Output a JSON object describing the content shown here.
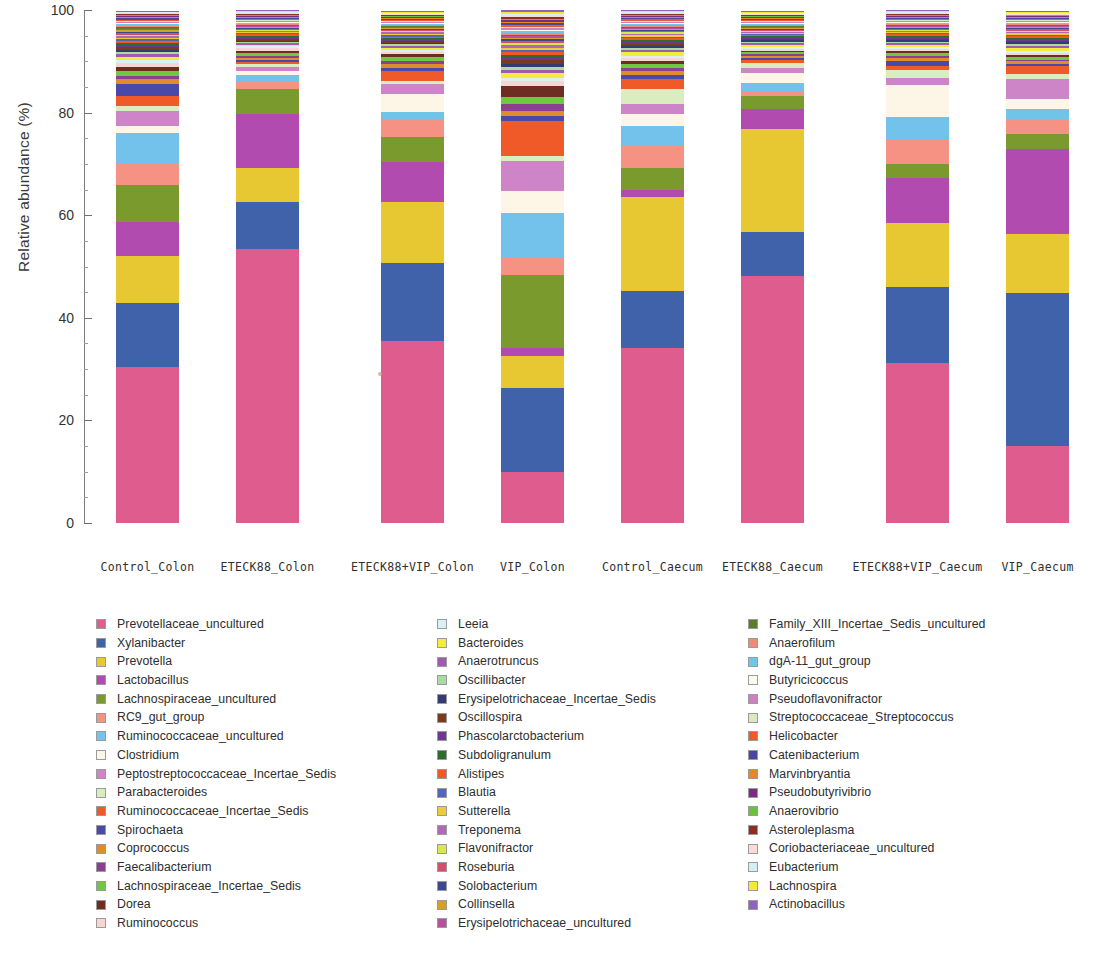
{
  "chart_data": {
    "type": "bar",
    "subtype": "stacked-bar-100-percent",
    "title": "",
    "xlabel": "",
    "ylabel": "Relative abundance (%)",
    "ylim": [
      0,
      100
    ],
    "yticks": [
      0,
      20,
      40,
      60,
      80,
      100
    ],
    "ytick_labels": [
      "0",
      "20",
      "40",
      "60",
      "80",
      "100"
    ],
    "grid": false,
    "legend_position": "bottom",
    "legend_columns": 3,
    "categories": [
      "Control_Colon",
      "ETECK88_Colon",
      "ETECK88+VIP_Colon",
      "VIP_Colon",
      "Control_Caecum",
      "ETECK88_Caecum",
      "ETECK88+VIP_Caecum",
      "VIP_Caecum"
    ],
    "series": [
      {
        "name": "Prevotellaceae_uncultured",
        "color": "#de5c8e",
        "values": [
          31.5,
          56.0,
          36.0,
          9.5,
          35.5,
          48.0,
          32.5,
          15.5
        ]
      },
      {
        "name": "Xylanibacter",
        "color": "#3f62aa",
        "values": [
          13.0,
          9.5,
          15.5,
          15.5,
          11.5,
          8.5,
          15.5,
          30.5
        ]
      },
      {
        "name": "Prevotella",
        "color": "#e8c832",
        "values": [
          9.5,
          7.0,
          12.0,
          6.0,
          19.0,
          20.0,
          13.0,
          12.0
        ]
      },
      {
        "name": "Lactobacillus",
        "color": "#b14bb0",
        "values": [
          7.0,
          11.0,
          8.0,
          1.5,
          1.5,
          4.0,
          9.0,
          17.0
        ]
      },
      {
        "name": "Lachnospiraceae_uncultured",
        "color": "#7a9a2e",
        "values": [
          7.5,
          5.0,
          5.0,
          13.5,
          4.5,
          2.5,
          3.0,
          3.0
        ]
      },
      {
        "name": "RC9_gut_group",
        "color": "#f59283",
        "values": [
          4.5,
          1.5,
          3.5,
          3.0,
          4.5,
          1.0,
          5.0,
          3.0
        ]
      },
      {
        "name": "Ruminococcaceae_uncultured",
        "color": "#73c2ec",
        "values": [
          6.0,
          1.5,
          1.5,
          8.5,
          4.0,
          1.5,
          4.5,
          2.0
        ]
      },
      {
        "name": "Clostridium",
        "color": "#fdf6e6",
        "values": [
          1.5,
          0.8,
          3.5,
          4.0,
          2.5,
          2.0,
          6.5,
          2.0
        ]
      },
      {
        "name": "Peptostreptococcaceae_Incertae_Sedis",
        "color": "#cd85c8",
        "values": [
          3.0,
          0.8,
          2.0,
          5.5,
          2.0,
          1.0,
          1.5,
          4.0
        ]
      },
      {
        "name": "Parabacteroides",
        "color": "#d9edc0",
        "values": [
          1.0,
          0.5,
          0.5,
          1.0,
          3.0,
          1.0,
          1.5,
          1.0
        ]
      },
      {
        "name": "Ruminococcaceae_Incertae_Sedis",
        "color": "#ef5a28",
        "values": [
          2.0,
          0.5,
          2.0,
          6.5,
          2.0,
          0.5,
          0.8,
          1.5
        ]
      },
      {
        "name": "Spirochaeta",
        "color": "#4a48a8",
        "values": [
          2.5,
          0.5,
          0.6,
          0.8,
          0.8,
          0.4,
          1.0,
          0.5
        ]
      },
      {
        "name": "Coprococcus",
        "color": "#e08c2a",
        "values": [
          0.9,
          0.4,
          0.9,
          1.0,
          0.9,
          0.4,
          0.6,
          0.5
        ]
      },
      {
        "name": "Faecalibacterium",
        "color": "#8b3f8f",
        "values": [
          0.6,
          0.4,
          0.6,
          1.3,
          0.6,
          0.4,
          0.5,
          0.4
        ]
      },
      {
        "name": "Lachnospiraceae_Incertae_Sedis",
        "color": "#6fc83f",
        "values": [
          1.0,
          0.5,
          0.8,
          1.4,
          0.8,
          0.3,
          0.5,
          0.6
        ]
      },
      {
        "name": "Dorea",
        "color": "#6e2d22",
        "values": [
          1.0,
          0.4,
          0.5,
          2.0,
          0.5,
          0.3,
          0.4,
          0.4
        ]
      },
      {
        "name": "Ruminococcus",
        "color": "#f7d6d2",
        "values": [
          0.8,
          0.6,
          0.4,
          0.8,
          0.7,
          0.4,
          0.5,
          0.4
        ]
      },
      {
        "name": "Leeia",
        "color": "#d9f0f5",
        "values": [
          0.6,
          0.4,
          0.4,
          0.7,
          0.5,
          0.3,
          0.4,
          0.4
        ]
      },
      {
        "name": "Bacteroides",
        "color": "#f3ec3a",
        "values": [
          0.6,
          0.3,
          0.5,
          0.8,
          0.8,
          0.5,
          0.5,
          0.6
        ]
      },
      {
        "name": "Anaerotruncus",
        "color": "#a05ab0",
        "values": [
          0.5,
          0.3,
          0.4,
          0.6,
          0.4,
          0.3,
          0.3,
          0.4
        ]
      },
      {
        "name": "Oscillibacter",
        "color": "#a8dca0",
        "values": [
          0.4,
          0.3,
          0.3,
          0.5,
          0.4,
          0.3,
          0.3,
          0.3
        ]
      },
      {
        "name": "Erysipelotrichaceae_Incertae_Sedis",
        "color": "#343b6e",
        "values": [
          0.5,
          0.3,
          0.3,
          0.7,
          0.4,
          0.3,
          0.3,
          0.4
        ]
      },
      {
        "name": "Oscillospira",
        "color": "#7a3b1c",
        "values": [
          0.5,
          0.4,
          0.3,
          0.6,
          0.4,
          0.3,
          0.3,
          0.3
        ]
      },
      {
        "name": "Phascolarctobacterium",
        "color": "#6b3a90",
        "values": [
          0.4,
          0.3,
          0.3,
          0.5,
          0.4,
          0.3,
          0.3,
          0.3
        ]
      },
      {
        "name": "Subdoligranulum",
        "color": "#2e6b2e",
        "values": [
          0.4,
          0.3,
          0.3,
          0.5,
          0.3,
          0.2,
          0.3,
          0.3
        ]
      },
      {
        "name": "Alistipes",
        "color": "#f05a22",
        "values": [
          0.4,
          0.3,
          0.3,
          0.5,
          0.4,
          0.2,
          0.3,
          0.3
        ]
      },
      {
        "name": "Blautia",
        "color": "#5566b8",
        "values": [
          0.4,
          0.3,
          0.3,
          0.5,
          0.3,
          0.2,
          0.3,
          0.3
        ]
      },
      {
        "name": "Sutterella",
        "color": "#edc93c",
        "values": [
          0.3,
          0.2,
          0.3,
          0.4,
          0.3,
          0.2,
          0.2,
          0.3
        ]
      },
      {
        "name": "Treponema",
        "color": "#b069b5",
        "values": [
          0.4,
          0.2,
          0.3,
          0.4,
          0.3,
          0.2,
          0.2,
          0.3
        ]
      },
      {
        "name": "Flavonifractor",
        "color": "#dbe84a",
        "values": [
          0.3,
          0.2,
          0.2,
          0.4,
          0.3,
          0.2,
          0.2,
          0.2
        ]
      },
      {
        "name": "Roseburia",
        "color": "#d4506a",
        "values": [
          0.3,
          0.2,
          0.3,
          0.4,
          0.3,
          0.2,
          0.2,
          0.3
        ]
      },
      {
        "name": "Solobacterium",
        "color": "#3a4a8f",
        "values": [
          0.3,
          0.2,
          0.2,
          0.3,
          0.2,
          0.2,
          0.2,
          0.2
        ]
      },
      {
        "name": "Collinsella",
        "color": "#d4a02a",
        "values": [
          0.3,
          0.2,
          0.2,
          0.3,
          0.3,
          0.2,
          0.2,
          0.2
        ]
      },
      {
        "name": "Erysipelotrichaceae_uncultured",
        "color": "#b8509e",
        "values": [
          0.3,
          0.2,
          0.2,
          0.3,
          0.2,
          0.2,
          0.2,
          0.2
        ]
      },
      {
        "name": "Family_XIII_Incertae_Sedis_uncultured",
        "color": "#5c7a2a",
        "values": [
          0.3,
          0.2,
          0.2,
          0.3,
          0.2,
          0.2,
          0.2,
          0.2
        ]
      },
      {
        "name": "Anaerofilum",
        "color": "#ef8a78",
        "values": [
          0.3,
          0.2,
          0.2,
          0.3,
          0.3,
          0.2,
          0.2,
          0.2
        ]
      },
      {
        "name": "dgA-11_gut_group",
        "color": "#6ec6e8",
        "values": [
          0.3,
          0.2,
          0.2,
          0.3,
          0.2,
          0.2,
          0.2,
          0.2
        ]
      },
      {
        "name": "Butyricicoccus",
        "color": "#fdfaf0",
        "values": [
          0.2,
          0.2,
          0.2,
          0.3,
          0.2,
          0.2,
          0.2,
          0.2
        ]
      },
      {
        "name": "Pseudoflavonifractor",
        "color": "#cf7fc2",
        "values": [
          0.3,
          0.2,
          0.2,
          0.3,
          0.2,
          0.2,
          0.2,
          0.2
        ]
      },
      {
        "name": "Streptococcaceae_Streptococcus",
        "color": "#dbe9c0",
        "values": [
          0.2,
          0.2,
          0.2,
          0.3,
          0.3,
          0.2,
          0.2,
          0.2
        ]
      },
      {
        "name": "Helicobacter",
        "color": "#ef5a2a",
        "values": [
          0.2,
          0.2,
          0.2,
          0.3,
          0.3,
          0.2,
          0.2,
          0.2
        ]
      },
      {
        "name": "Catenibacterium",
        "color": "#4848a0",
        "values": [
          0.3,
          0.2,
          0.2,
          0.3,
          0.2,
          0.2,
          0.2,
          0.2
        ]
      },
      {
        "name": "Marvinbryantia",
        "color": "#e8891f",
        "values": [
          0.2,
          0.2,
          0.2,
          0.3,
          0.2,
          0.2,
          0.2,
          0.2
        ]
      },
      {
        "name": "Pseudobutyrivibrio",
        "color": "#7a2d7e",
        "values": [
          0.2,
          0.2,
          0.2,
          0.3,
          0.2,
          0.2,
          0.2,
          0.2
        ]
      },
      {
        "name": "Anaerovibrio",
        "color": "#6ac23c",
        "values": [
          0.2,
          0.2,
          0.2,
          0.3,
          0.2,
          0.2,
          0.2,
          0.2
        ]
      },
      {
        "name": "Asteroleplasma",
        "color": "#8c2f22",
        "values": [
          0.2,
          0.2,
          0.2,
          0.3,
          0.2,
          0.2,
          0.2,
          0.2
        ]
      },
      {
        "name": "Coriobacteriaceae_uncultured",
        "color": "#f7dcd6",
        "values": [
          0.2,
          0.2,
          0.2,
          0.3,
          0.2,
          0.2,
          0.2,
          0.2
        ]
      },
      {
        "name": "Eubacterium",
        "color": "#d5eef5",
        "values": [
          0.2,
          0.2,
          0.2,
          0.3,
          0.2,
          0.2,
          0.2,
          0.2
        ]
      },
      {
        "name": "Lachnospira",
        "color": "#f5ea33",
        "values": [
          0.2,
          0.2,
          0.2,
          0.3,
          0.2,
          0.2,
          0.2,
          0.2
        ]
      },
      {
        "name": "Actinobacillus",
        "color": "#8e63c0",
        "values": [
          0.2,
          0.2,
          0.2,
          0.3,
          0.2,
          0.2,
          0.2,
          0.2
        ]
      }
    ]
  },
  "axis": {
    "ylabel": "Relative abundance (%)",
    "ytick_labels": [
      "100",
      "80",
      "60",
      "40",
      "20",
      "0"
    ]
  },
  "legend": {
    "columns": [
      {
        "items": [
          {
            "label": "Prevotellaceae_uncultured",
            "color": "#de5c8e"
          },
          {
            "label": "Xylanibacter",
            "color": "#3f62aa"
          },
          {
            "label": "Prevotella",
            "color": "#e8c832"
          },
          {
            "label": "Lactobacillus",
            "color": "#b14bb0"
          },
          {
            "label": "Lachnospiraceae_uncultured",
            "color": "#7a9a2e"
          },
          {
            "label": "RC9_gut_group",
            "color": "#f59283"
          },
          {
            "label": "Ruminococcaceae_uncultured",
            "color": "#73c2ec"
          },
          {
            "label": "Clostridium",
            "color": "#fdf6e6"
          },
          {
            "label": "Peptostreptococcaceae_Incertae_Sedis",
            "color": "#cd85c8"
          },
          {
            "label": "Parabacteroides",
            "color": "#d9edc0"
          },
          {
            "label": "Ruminococcaceae_Incertae_Sedis",
            "color": "#ef5a28"
          },
          {
            "label": "Spirochaeta",
            "color": "#4a48a8"
          },
          {
            "label": "Coprococcus",
            "color": "#e08c2a"
          },
          {
            "label": "Faecalibacterium",
            "color": "#8b3f8f"
          },
          {
            "label": "Lachnospiraceae_Incertae_Sedis",
            "color": "#6fc83f"
          },
          {
            "label": "Dorea",
            "color": "#6e2d22"
          },
          {
            "label": "Ruminococcus",
            "color": "#f7d6d2"
          }
        ]
      },
      {
        "items": [
          {
            "label": "Leeia",
            "color": "#d9f0f5"
          },
          {
            "label": "Bacteroides",
            "color": "#f3ec3a"
          },
          {
            "label": "Anaerotruncus",
            "color": "#a05ab0"
          },
          {
            "label": "Oscillibacter",
            "color": "#a8dca0"
          },
          {
            "label": "Erysipelotrichaceae_Incertae_Sedis",
            "color": "#343b6e"
          },
          {
            "label": "Oscillospira",
            "color": "#7a3b1c"
          },
          {
            "label": "Phascolarctobacterium",
            "color": "#6b3a90"
          },
          {
            "label": "Subdoligranulum",
            "color": "#2e6b2e"
          },
          {
            "label": "Alistipes",
            "color": "#f05a22"
          },
          {
            "label": "Blautia",
            "color": "#5566b8"
          },
          {
            "label": "Sutterella",
            "color": "#edc93c"
          },
          {
            "label": "Treponema",
            "color": "#b069b5"
          },
          {
            "label": "Flavonifractor",
            "color": "#dbe84a"
          },
          {
            "label": "Roseburia",
            "color": "#d4506a"
          },
          {
            "label": "Solobacterium",
            "color": "#3a4a8f"
          },
          {
            "label": "Collinsella",
            "color": "#d4a02a"
          },
          {
            "label": "Erysipelotrichaceae_uncultured",
            "color": "#b8509e"
          }
        ]
      },
      {
        "items": [
          {
            "label": "Family_XIII_Incertae_Sedis_uncultured",
            "color": "#5c7a2a"
          },
          {
            "label": "Anaerofilum",
            "color": "#ef8a78"
          },
          {
            "label": "dgA-11_gut_group",
            "color": "#6ec6e8"
          },
          {
            "label": "Butyricicoccus",
            "color": "#fdfaf0"
          },
          {
            "label": "Pseudoflavonifractor",
            "color": "#cf7fc2"
          },
          {
            "label": "Streptococcaceae_Streptococcus",
            "color": "#dbe9c0"
          },
          {
            "label": "Helicobacter",
            "color": "#ef5a2a"
          },
          {
            "label": "Catenibacterium",
            "color": "#4848a0"
          },
          {
            "label": "Marvinbryantia",
            "color": "#e8891f"
          },
          {
            "label": "Pseudobutyrivibrio",
            "color": "#7a2d7e"
          },
          {
            "label": "Anaerovibrio",
            "color": "#6ac23c"
          },
          {
            "label": "Asteroleplasma",
            "color": "#8c2f22"
          },
          {
            "label": "Coriobacteriaceae_uncultured",
            "color": "#f7dcd6"
          },
          {
            "label": "Eubacterium",
            "color": "#d5eef5"
          },
          {
            "label": "Lachnospira",
            "color": "#f5ea33"
          },
          {
            "label": "Actinobacillus",
            "color": "#8e63c0"
          }
        ]
      }
    ]
  }
}
